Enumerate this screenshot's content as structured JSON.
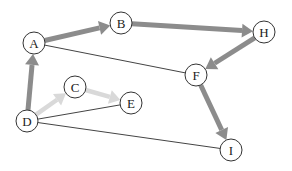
{
  "diagram": {
    "type": "directed-graph",
    "colors": {
      "thick_edge": "#8c8c8c",
      "light_edge": "#d9d9d9",
      "thin_edge": "#444444",
      "node_stroke": "#333333",
      "node_fill": "#ffffff"
    },
    "nodes": [
      {
        "id": "A",
        "label": "A",
        "x": 34,
        "y": 43
      },
      {
        "id": "B",
        "label": "B",
        "x": 121,
        "y": 23
      },
      {
        "id": "H",
        "label": "H",
        "x": 264,
        "y": 32
      },
      {
        "id": "F",
        "label": "F",
        "x": 196,
        "y": 75
      },
      {
        "id": "C",
        "label": "C",
        "x": 75,
        "y": 87
      },
      {
        "id": "E",
        "label": "E",
        "x": 131,
        "y": 103
      },
      {
        "id": "D",
        "label": "D",
        "x": 27,
        "y": 121
      },
      {
        "id": "I",
        "label": "I",
        "x": 231,
        "y": 150
      }
    ],
    "edges": [
      {
        "from": "A",
        "to": "B",
        "style": "thick",
        "directed": true
      },
      {
        "from": "B",
        "to": "H",
        "style": "thick",
        "directed": true
      },
      {
        "from": "H",
        "to": "F",
        "style": "thick",
        "directed": true
      },
      {
        "from": "F",
        "to": "I",
        "style": "thick",
        "directed": true
      },
      {
        "from": "D",
        "to": "A",
        "style": "thick",
        "directed": true
      },
      {
        "from": "D",
        "to": "C",
        "style": "light",
        "directed": true
      },
      {
        "from": "C",
        "to": "E",
        "style": "light",
        "directed": true
      },
      {
        "from": "A",
        "to": "F",
        "style": "thin",
        "directed": false
      },
      {
        "from": "D",
        "to": "E",
        "style": "thin",
        "directed": false
      },
      {
        "from": "D",
        "to": "I",
        "style": "thin",
        "directed": false
      }
    ]
  }
}
